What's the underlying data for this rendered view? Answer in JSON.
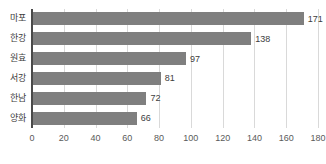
{
  "chart_data": {
    "type": "bar",
    "orientation": "horizontal",
    "title": "",
    "subtitle": "",
    "xlabel": "",
    "ylabel": "",
    "categories": [
      "마포",
      "한강",
      "원효",
      "서강",
      "한남",
      "양화"
    ],
    "values": [
      171,
      138,
      97,
      81,
      72,
      66
    ],
    "data_labels": [
      "171",
      "138",
      "97",
      "81",
      "72",
      "66"
    ],
    "xlim": [
      0,
      180
    ],
    "ylim": null,
    "xticks": [
      0,
      20,
      40,
      60,
      80,
      100,
      120,
      140,
      160,
      180
    ],
    "xtick_labels": [
      "0",
      "20",
      "40",
      "60",
      "80",
      "100",
      "120",
      "140",
      "160",
      "180"
    ],
    "grid": {
      "vertical": true,
      "horizontal": false
    },
    "legend": {
      "show": false,
      "position": "none",
      "entries": []
    },
    "colors": {
      "bar": "#7f7f7f",
      "gridline": "#d9d9d9",
      "axis_line": "#4a4a4a",
      "label_text": "#3d3d3d",
      "tick_text": "#5a5a5a",
      "background": "#ffffff"
    },
    "annotations": []
  }
}
